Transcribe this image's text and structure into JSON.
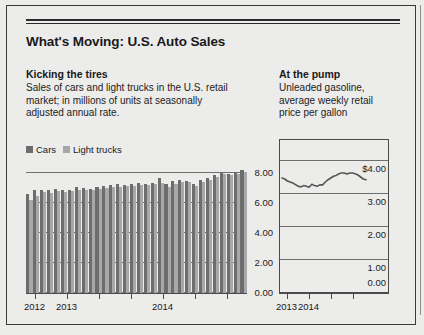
{
  "headline": "What's Moving: U.S. Auto Sales",
  "left_panel": {
    "deck_title": "Kicking the tires",
    "deck_lines": [
      "Sales of cars and light trucks in the U.S. retail",
      "market; in millions of units at seasonally",
      "adjusted annual rate."
    ],
    "legend": [
      {
        "label": "Cars",
        "color": "#6d6d6d"
      },
      {
        "label": "Light trucks",
        "color": "#a8a8a8"
      }
    ]
  },
  "right_panel": {
    "deck_title": "At the pump",
    "deck_lines": [
      "Unleaded gasoline,",
      "average weekly retail",
      "price per gallon"
    ]
  },
  "chart_data": [
    {
      "id": "auto-sales-bars",
      "type": "bar",
      "title": "Kicking the tires",
      "xlabel": "",
      "ylabel": "millions of units, SAAR",
      "ylim": [
        0,
        9
      ],
      "yticks": [
        0,
        2,
        4,
        6,
        8
      ],
      "ytick_labels": [
        "0.00",
        "2.00",
        "4.00",
        "6.00",
        "8.00"
      ],
      "grid": true,
      "legend_position": "above-left",
      "xtick_labels": [
        "2012",
        "2013",
        "",
        "",
        "2014",
        "",
        ""
      ],
      "categories": [
        "2012-M1",
        "2012-M2",
        "2012-M3",
        "2012-M4",
        "2012-M5",
        "2012-M6",
        "2012-M7",
        "2012-M8",
        "2012-M9",
        "2012-M10",
        "2012-M11",
        "2012-M12",
        "2013-M1",
        "2013-M2",
        "2013-M3",
        "2013-M4",
        "2013-M5",
        "2013-M6",
        "2013-M7",
        "2013-M8",
        "2013-M9",
        "2013-M10",
        "2013-M11",
        "2013-M12",
        "2014-M1",
        "2014-M2",
        "2014-M3",
        "2014-M4",
        "2014-M5",
        "2014-M6",
        "2014-M7",
        "2014-M8"
      ],
      "series": [
        {
          "name": "Cars",
          "color": "#6d6d6d",
          "values": [
            6.6,
            6.85,
            6.9,
            6.85,
            6.95,
            6.85,
            6.9,
            7.05,
            7.0,
            6.95,
            7.1,
            7.15,
            7.2,
            7.25,
            7.2,
            7.3,
            7.35,
            7.3,
            7.35,
            7.7,
            7.25,
            7.45,
            7.55,
            7.5,
            7.3,
            7.55,
            7.7,
            7.9,
            8.1,
            7.95,
            8.05,
            8.2
          ]
        },
        {
          "name": "Light trucks",
          "color": "#a8a8a8",
          "values": [
            6.2,
            6.5,
            6.75,
            6.7,
            6.8,
            6.75,
            6.8,
            6.9,
            6.85,
            6.85,
            6.95,
            7.0,
            7.05,
            7.1,
            7.15,
            7.15,
            7.2,
            7.2,
            7.25,
            7.35,
            7.05,
            7.3,
            7.4,
            7.4,
            7.15,
            7.4,
            7.55,
            7.75,
            7.95,
            7.85,
            7.95,
            8.1
          ]
        }
      ]
    },
    {
      "id": "gas-price-line",
      "type": "line",
      "title": "At the pump",
      "xlabel": "",
      "ylabel": "dollars per gallon",
      "ylim": [
        0,
        4.6
      ],
      "yticks": [
        0,
        1,
        2,
        3,
        4
      ],
      "ytick_labels": [
        "0.00",
        "1.00",
        "2.00",
        "3.00",
        "$4.00"
      ],
      "grid": true,
      "xtick_labels": [
        "2013",
        "2014",
        "",
        ""
      ],
      "line_color": "#555555",
      "x": [
        0,
        1,
        2,
        3,
        4,
        5,
        6,
        7,
        8,
        9,
        10,
        11,
        12,
        13,
        14,
        15,
        16,
        17,
        18,
        19,
        20,
        21,
        22,
        23,
        24,
        25,
        26,
        27,
        28,
        29,
        30,
        31
      ],
      "values": [
        3.45,
        3.42,
        3.36,
        3.33,
        3.3,
        3.25,
        3.2,
        3.18,
        3.22,
        3.2,
        3.17,
        3.26,
        3.22,
        3.2,
        3.24,
        3.24,
        3.33,
        3.4,
        3.45,
        3.5,
        3.53,
        3.58,
        3.6,
        3.6,
        3.57,
        3.6,
        3.6,
        3.58,
        3.54,
        3.48,
        3.42,
        3.4
      ]
    }
  ]
}
